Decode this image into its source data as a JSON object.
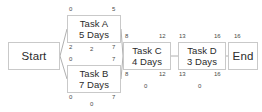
{
  "diagram": {
    "type": "pert-cpm-network-diagram",
    "nodes": [
      {
        "id": "start",
        "label": "Start",
        "duration": "",
        "x": 8,
        "y": 42,
        "w": 52,
        "h": 28
      },
      {
        "id": "taskA",
        "label": "Task A",
        "duration": "5 Days",
        "x": 67,
        "y": 15,
        "w": 54,
        "h": 28
      },
      {
        "id": "taskB",
        "label": "Task B",
        "duration": "7 Days",
        "x": 67,
        "y": 65,
        "w": 54,
        "h": 28
      },
      {
        "id": "taskC",
        "label": "Task C",
        "duration": "4 Days",
        "x": 123,
        "y": 42,
        "w": 48,
        "h": 28
      },
      {
        "id": "taskD",
        "label": "Task D",
        "duration": "3 Days",
        "x": 178,
        "y": 42,
        "w": 48,
        "h": 28
      },
      {
        "id": "end",
        "label": "End",
        "duration": "",
        "x": 228,
        "y": 42,
        "w": 30,
        "h": 28
      }
    ],
    "annotations": [
      {
        "id": "a-es",
        "node": "taskA",
        "role": "early-start",
        "value": "0",
        "x": 69,
        "y": 6
      },
      {
        "id": "a-ef",
        "node": "taskA",
        "role": "early-finish",
        "value": "5",
        "x": 112,
        "y": 6
      },
      {
        "id": "a-ls",
        "node": "taskA",
        "role": "late-start",
        "value": "2",
        "x": 69,
        "y": 44
      },
      {
        "id": "a-fl",
        "node": "taskA",
        "role": "float",
        "value": "2",
        "x": 90,
        "y": 46
      },
      {
        "id": "a-lf",
        "node": "taskA",
        "role": "late-finish",
        "value": "7",
        "x": 112,
        "y": 44
      },
      {
        "id": "b-es",
        "node": "taskB",
        "role": "early-start",
        "value": "0",
        "x": 69,
        "y": 56
      },
      {
        "id": "b-ef",
        "node": "taskB",
        "role": "early-finish",
        "value": "7",
        "x": 112,
        "y": 56
      },
      {
        "id": "b-ls",
        "node": "taskB",
        "role": "late-start",
        "value": "0",
        "x": 69,
        "y": 94
      },
      {
        "id": "b-lf",
        "node": "taskB",
        "role": "late-finish",
        "value": "7",
        "x": 112,
        "y": 94
      },
      {
        "id": "b-fl",
        "node": "taskB",
        "role": "float",
        "value": "0",
        "x": 90,
        "y": 101
      },
      {
        "id": "c-es",
        "node": "taskC",
        "role": "early-start",
        "value": "8",
        "x": 125,
        "y": 33
      },
      {
        "id": "c-ef",
        "node": "taskC",
        "role": "early-finish",
        "value": "12",
        "x": 159,
        "y": 33
      },
      {
        "id": "c-ls",
        "node": "taskC",
        "role": "late-start",
        "value": "8",
        "x": 125,
        "y": 71
      },
      {
        "id": "c-lf",
        "node": "taskC",
        "role": "late-finish",
        "value": "12",
        "x": 159,
        "y": 71
      },
      {
        "id": "c-fl",
        "node": "taskC",
        "role": "float",
        "value": "0",
        "x": 144,
        "y": 83
      },
      {
        "id": "d-es",
        "node": "taskD",
        "role": "early-start",
        "value": "13",
        "x": 179,
        "y": 33
      },
      {
        "id": "d-ef",
        "node": "taskD",
        "role": "early-finish",
        "value": "16",
        "x": 214,
        "y": 33
      },
      {
        "id": "d-ls",
        "node": "taskD",
        "role": "late-start",
        "value": "13",
        "x": 179,
        "y": 71
      },
      {
        "id": "d-lf",
        "node": "taskD",
        "role": "late-finish",
        "value": "16",
        "x": 214,
        "y": 71
      },
      {
        "id": "d-fl",
        "node": "taskD",
        "role": "float",
        "value": "0",
        "x": 198,
        "y": 83
      },
      {
        "id": "e-ef",
        "node": "end",
        "role": "early-finish",
        "value": "16",
        "x": 234,
        "y": 33
      }
    ],
    "edges": [
      {
        "id": "start-taskA",
        "from": "start",
        "to": "taskA",
        "d": "M60,56 L67,29"
      },
      {
        "id": "start-taskB",
        "from": "start",
        "to": "taskB",
        "d": "M60,56 L67,79"
      },
      {
        "id": "taskA-taskC",
        "from": "taskA",
        "to": "taskC",
        "d": "M121,29 L123,56"
      },
      {
        "id": "taskB-taskC",
        "from": "taskB",
        "to": "taskC",
        "d": "M121,79 L123,56"
      },
      {
        "id": "taskC-taskD",
        "from": "taskC",
        "to": "taskD",
        "d": "M171,56 L178,56"
      },
      {
        "id": "taskD-end",
        "from": "taskD",
        "to": "end",
        "d": "M226,56 L228,56"
      }
    ],
    "colors": {
      "node_border": "#c9c9c9",
      "node_fill": "#ffffff",
      "edge": "#b0b0b0",
      "text": "#2b2b2b",
      "annotation_text": "#4a4a4a",
      "background": "#ffffff"
    }
  }
}
